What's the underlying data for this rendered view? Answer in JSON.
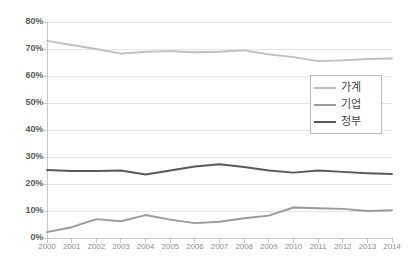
{
  "chart_data": {
    "type": "line",
    "title": "",
    "subtitle": "",
    "xlabel": "",
    "ylabel": "",
    "categories": [
      "2000",
      "2001",
      "2002",
      "2003",
      "2004",
      "2005",
      "2006",
      "2007",
      "2008",
      "2009",
      "2010",
      "2011",
      "2012",
      "2013",
      "2014"
    ],
    "x": [
      2000,
      2001,
      2002,
      2003,
      2004,
      2005,
      2006,
      2007,
      2008,
      2009,
      2010,
      2011,
      2012,
      2013,
      2014
    ],
    "ylim": [
      0,
      80
    ],
    "ytick_labels": [
      "0%",
      "10%",
      "20%",
      "30%",
      "40%",
      "50%",
      "60%",
      "70%",
      "80%"
    ],
    "ytick_values": [
      0,
      10,
      20,
      30,
      40,
      50,
      60,
      70,
      80
    ],
    "grid": "horizontal",
    "legend_position": "center-right",
    "series": [
      {
        "name": "가계",
        "color": "#bfbfbf",
        "values": [
          73.0,
          71.5,
          70.0,
          68.3,
          69.0,
          69.2,
          68.8,
          69.0,
          69.5,
          68.0,
          67.0,
          65.5,
          65.8,
          66.3,
          66.5
        ]
      },
      {
        "name": "기업",
        "color": "#9a9a9a",
        "values": [
          2.2,
          4.0,
          7.0,
          6.2,
          8.5,
          6.8,
          5.5,
          6.0,
          7.3,
          8.3,
          11.3,
          11.0,
          10.8,
          10.0,
          10.3
        ]
      },
      {
        "name": "정부",
        "color": "#595959",
        "values": [
          25.2,
          24.8,
          24.8,
          25.0,
          23.5,
          25.0,
          26.5,
          27.3,
          26.3,
          25.0,
          24.2,
          25.0,
          24.5,
          24.0,
          23.7
        ]
      }
    ]
  },
  "axes": {
    "y_ticks": [
      {
        "label": "80%",
        "value": 80
      },
      {
        "label": "70%",
        "value": 70
      },
      {
        "label": "60%",
        "value": 60
      },
      {
        "label": "50%",
        "value": 50
      },
      {
        "label": "40%",
        "value": 40
      },
      {
        "label": "30%",
        "value": 30
      },
      {
        "label": "20%",
        "value": 20
      },
      {
        "label": "10%",
        "value": 10
      },
      {
        "label": "0%",
        "value": 0
      }
    ],
    "x_ticks": [
      {
        "label": "2000"
      },
      {
        "label": "2001"
      },
      {
        "label": "2002"
      },
      {
        "label": "2003"
      },
      {
        "label": "2004"
      },
      {
        "label": "2005"
      },
      {
        "label": "2006"
      },
      {
        "label": "2007"
      },
      {
        "label": "2008"
      },
      {
        "label": "2009"
      },
      {
        "label": "2010"
      },
      {
        "label": "2011"
      },
      {
        "label": "2012"
      },
      {
        "label": "2013"
      },
      {
        "label": "2014"
      }
    ]
  },
  "legend": {
    "items": [
      {
        "label": "가계",
        "color": "#bfbfbf"
      },
      {
        "label": "기업",
        "color": "#9a9a9a"
      },
      {
        "label": "정부",
        "color": "#595959"
      }
    ]
  },
  "style": {
    "background": "#ffffff",
    "grid_color": "#e4e4e4",
    "axis_color": "#c8c8c8",
    "tick_text_color": "#8e8e8e",
    "y_label_color": "#5a5a5a",
    "legend_border": "#b9b9b9"
  }
}
